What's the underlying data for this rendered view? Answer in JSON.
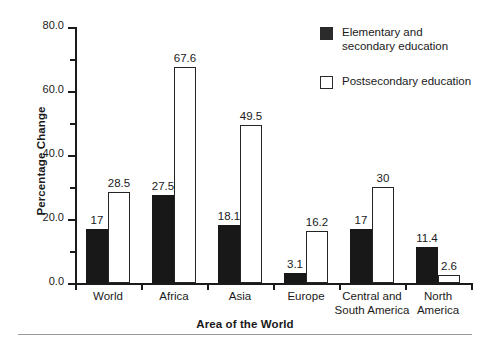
{
  "chart_data": {
    "type": "bar",
    "title": "",
    "xlabel": "Area of the World",
    "ylabel": "Percentage Change",
    "categories": [
      "World",
      "Africa",
      "Asia",
      "Europe",
      "Central and South America",
      "North America"
    ],
    "category_lines": [
      [
        "World"
      ],
      [
        "Africa"
      ],
      [
        "Asia"
      ],
      [
        "Europe"
      ],
      [
        "Central and",
        "South America"
      ],
      [
        "North",
        "America"
      ]
    ],
    "series": [
      {
        "name": "Elementary and secondary education",
        "legend_lines": [
          "Elementary and",
          "secondary education"
        ],
        "color": "#181818",
        "fill": "solid",
        "values": [
          17,
          27.5,
          18.1,
          3.1,
          17,
          11.4
        ],
        "value_labels": [
          "17",
          "27.5",
          "18.1",
          "3.1",
          "17",
          "11.4"
        ]
      },
      {
        "name": "Postsecondary education",
        "legend_lines": [
          "Postsecondary education"
        ],
        "color": "#ffffff",
        "fill": "outline",
        "values": [
          28.5,
          67.6,
          49.5,
          16.2,
          30,
          2.6
        ],
        "value_labels": [
          "28.5",
          "67.6",
          "49.5",
          "16.2",
          "30",
          "2.6"
        ]
      }
    ],
    "ylim": [
      0,
      80
    ],
    "yticks": [
      0,
      20,
      40,
      60,
      80
    ],
    "ytick_labels": [
      "0.0",
      "20.0",
      "40.0",
      "60.0",
      "80.0"
    ],
    "yticks_minor": [
      10,
      30,
      50,
      70
    ],
    "grid": false,
    "legend_position": "top-right"
  },
  "axis": {
    "y_title": "Percentage Change",
    "x_title": "Area of the World",
    "y_tick_0": "0.0",
    "y_tick_20": "20.0",
    "y_tick_40": "40.0",
    "y_tick_60": "60.0",
    "y_tick_80": "80.0"
  },
  "legend": {
    "items": [
      {
        "label": "Elementary and\nsecondary education",
        "swatch": "filled-black-square"
      },
      {
        "label": "Postsecondary education",
        "swatch": "outlined-white-square"
      }
    ]
  },
  "bars": {
    "world": {
      "elementary": "17",
      "postsecondary": "28.5",
      "label": "World"
    },
    "africa": {
      "elementary": "27.5",
      "postsecondary": "67.6",
      "label": "Africa"
    },
    "asia": {
      "elementary": "18.1",
      "postsecondary": "49.5",
      "label": "Asia"
    },
    "europe": {
      "elementary": "3.1",
      "postsecondary": "16.2",
      "label": "Europe"
    },
    "central_south_america": {
      "elementary": "17",
      "postsecondary": "30",
      "label_line1": "Central and",
      "label_line2": "South America"
    },
    "north_america": {
      "elementary": "11.4",
      "postsecondary": "2.6",
      "label_line1": "North",
      "label_line2": "America"
    }
  }
}
